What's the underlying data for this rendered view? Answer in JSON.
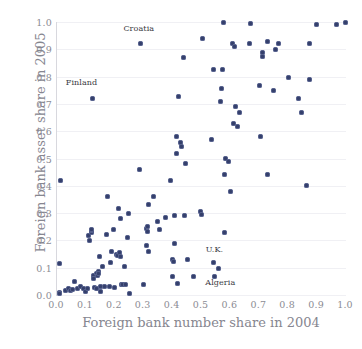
{
  "chart_data": {
    "type": "scatter",
    "title": "",
    "xlabel": "Foreign bank number share in 2004",
    "ylabel": "Foreign bank asset share in 2005",
    "xlim": [
      0.0,
      1.0
    ],
    "ylim": [
      0.0,
      1.0
    ],
    "grid": true,
    "legend": null,
    "xticks": [
      "0.0",
      "0.1",
      "0.2",
      "0.3",
      "0.4",
      "0.5",
      "0.6",
      "0.7",
      "0.8",
      "0.9",
      "1.0"
    ],
    "yticks": [
      "0.0",
      "0.1",
      "0.2",
      "0.3",
      "0.4",
      "0.5",
      "0.6",
      "0.7",
      "0.8",
      "0.9",
      "1.0"
    ],
    "marker_color": "#343f6b",
    "gridline_color": "#f0f0f4",
    "axis_color": "#d8d8de",
    "tick_label_color": "#8b8b93",
    "axis_title_color": "#86868f",
    "annotations": [
      {
        "label": "Croatia",
        "x": 0.283,
        "y": 0.975
      },
      {
        "label": "Finland",
        "x": 0.085,
        "y": 0.775
      },
      {
        "label": "U.K.",
        "x": 0.545,
        "y": 0.165
      },
      {
        "label": "Algeria",
        "x": 0.565,
        "y": 0.045
      }
    ],
    "points": [
      [
        0.012,
        0.42
      ],
      [
        0.01,
        0.115
      ],
      [
        0.008,
        0.01
      ],
      [
        0.01,
        0.005
      ],
      [
        0.03,
        0.018
      ],
      [
        0.04,
        0.022
      ],
      [
        0.048,
        0.015
      ],
      [
        0.055,
        0.02
      ],
      [
        0.062,
        0.05
      ],
      [
        0.07,
        0.022
      ],
      [
        0.08,
        0.03
      ],
      [
        0.09,
        0.022
      ],
      [
        0.098,
        0.012
      ],
      [
        0.105,
        0.025
      ],
      [
        0.11,
        0.218
      ],
      [
        0.113,
        0.2
      ],
      [
        0.118,
        0.228
      ],
      [
        0.12,
        0.235
      ],
      [
        0.12,
        0.24
      ],
      [
        0.122,
        0.72
      ],
      [
        0.125,
        0.07
      ],
      [
        0.128,
        0.062
      ],
      [
        0.13,
        0.028
      ],
      [
        0.135,
        0.022
      ],
      [
        0.138,
        0.08
      ],
      [
        0.14,
        0.072
      ],
      [
        0.142,
        0.085
      ],
      [
        0.145,
        0.078
      ],
      [
        0.148,
        0.14
      ],
      [
        0.15,
        0.03
      ],
      [
        0.152,
        0.012
      ],
      [
        0.158,
        0.103
      ],
      [
        0.165,
        0.03
      ],
      [
        0.17,
        0.22
      ],
      [
        0.175,
        0.362
      ],
      [
        0.18,
        0.03
      ],
      [
        0.185,
        0.118
      ],
      [
        0.188,
        0.16
      ],
      [
        0.195,
        0.24
      ],
      [
        0.198,
        0.028
      ],
      [
        0.205,
        0.148
      ],
      [
        0.208,
        0.145
      ],
      [
        0.212,
        0.318
      ],
      [
        0.215,
        0.155
      ],
      [
        0.218,
        0.282
      ],
      [
        0.22,
        0.14
      ],
      [
        0.222,
        0.04
      ],
      [
        0.228,
        0.04
      ],
      [
        0.232,
        0.105
      ],
      [
        0.238,
        0.04
      ],
      [
        0.245,
        0.21
      ],
      [
        0.248,
        0.3
      ],
      [
        0.252,
        0.005
      ],
      [
        0.285,
        0.46
      ],
      [
        0.288,
        0.92
      ],
      [
        0.3,
        0.04
      ],
      [
        0.308,
        0.182
      ],
      [
        0.31,
        0.245
      ],
      [
        0.312,
        0.25
      ],
      [
        0.312,
        0.232
      ],
      [
        0.315,
        0.16
      ],
      [
        0.318,
        0.33
      ],
      [
        0.335,
        0.362
      ],
      [
        0.348,
        0.268
      ],
      [
        0.355,
        0.24
      ],
      [
        0.375,
        0.283
      ],
      [
        0.392,
        0.418
      ],
      [
        0.398,
        0.068
      ],
      [
        0.4,
        0.13
      ],
      [
        0.402,
        0.122
      ],
      [
        0.405,
        0.19
      ],
      [
        0.408,
        0.29
      ],
      [
        0.412,
        0.52
      ],
      [
        0.415,
        0.58
      ],
      [
        0.418,
        0.042
      ],
      [
        0.422,
        0.728
      ],
      [
        0.428,
        0.56
      ],
      [
        0.432,
        0.545
      ],
      [
        0.438,
        0.87
      ],
      [
        0.442,
        0.29
      ],
      [
        0.445,
        0.482
      ],
      [
        0.452,
        0.13
      ],
      [
        0.472,
        0.068
      ],
      [
        0.498,
        0.305
      ],
      [
        0.5,
        0.295
      ],
      [
        0.502,
        0.94
      ],
      [
        0.535,
        0.57
      ],
      [
        0.54,
        0.825
      ],
      [
        0.542,
        0.118
      ],
      [
        0.545,
        0.068
      ],
      [
        0.558,
        0.098
      ],
      [
        0.565,
        0.71
      ],
      [
        0.57,
        0.758
      ],
      [
        0.572,
        0.825
      ],
      [
        0.575,
        1.0
      ],
      [
        0.578,
        0.44
      ],
      [
        0.58,
        0.23
      ],
      [
        0.582,
        0.5
      ],
      [
        0.595,
        0.49
      ],
      [
        0.6,
        0.38
      ],
      [
        0.608,
        0.92
      ],
      [
        0.612,
        0.628
      ],
      [
        0.615,
        0.91
      ],
      [
        0.618,
        0.69
      ],
      [
        0.625,
        0.618
      ],
      [
        0.632,
        0.668
      ],
      [
        0.665,
        0.92
      ],
      [
        0.67,
        0.995
      ],
      [
        0.7,
        0.768
      ],
      [
        0.705,
        0.58
      ],
      [
        0.71,
        0.89
      ],
      [
        0.712,
        0.872
      ],
      [
        0.728,
        0.93
      ],
      [
        0.73,
        0.44
      ],
      [
        0.75,
        0.748
      ],
      [
        0.755,
        0.9
      ],
      [
        0.768,
        0.92
      ],
      [
        0.8,
        0.798
      ],
      [
        0.835,
        0.718
      ],
      [
        0.845,
        0.668
      ],
      [
        0.862,
        0.4
      ],
      [
        0.872,
        0.92
      ],
      [
        0.875,
        0.788
      ],
      [
        0.898,
        0.992
      ],
      [
        0.968,
        0.992
      ],
      [
        0.998,
        0.998
      ]
    ]
  }
}
